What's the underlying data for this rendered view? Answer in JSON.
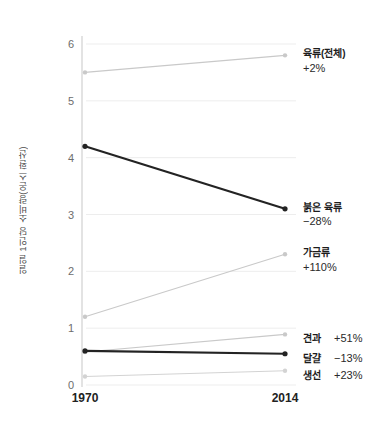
{
  "chart_data": {
    "type": "line",
    "title": "",
    "subtitle": "",
    "xlabel": "",
    "ylabel": "일일 1인당 소비량(온스 환산)",
    "x": [
      "1970",
      "2014"
    ],
    "xtick_labels": [
      "1970",
      "2014"
    ],
    "ytick_labels": [
      "0",
      "1",
      "2",
      "3",
      "4",
      "5",
      "6"
    ],
    "ylim": [
      0,
      6.2
    ],
    "yticks": [
      0,
      1,
      2,
      3,
      4,
      5,
      6
    ],
    "grid": true,
    "legend_position": "right-inline-annotations",
    "series": [
      {
        "name": "육류(전체)",
        "change": "+2%",
        "values": [
          5.5,
          5.8
        ],
        "color": "#c9c9c9",
        "emphasis": false
      },
      {
        "name": "붉은 육류",
        "change": "−28%",
        "values": [
          4.2,
          3.1
        ],
        "color": "#232323",
        "emphasis": true
      },
      {
        "name": "가금류",
        "change": "+110%",
        "values": [
          1.2,
          2.3
        ],
        "color": "#c9c9c9",
        "emphasis": false
      },
      {
        "name": "견과",
        "change": "+51%",
        "values": [
          0.58,
          0.89
        ],
        "color": "#c9c9c9",
        "emphasis": false
      },
      {
        "name": "달걀",
        "change": "−13%",
        "values": [
          0.6,
          0.55
        ],
        "color": "#232323",
        "emphasis": true
      },
      {
        "name": "생선",
        "change": "+23%",
        "values": [
          0.15,
          0.25
        ],
        "color": "#d3d3d3",
        "emphasis": false
      }
    ]
  },
  "style": {
    "background": "#ffffff",
    "grid_color": "#ededed",
    "axis_color": "#d0d0d0",
    "tick_text_color": "#6d6d6d",
    "label_text_color": "#1c1c1c",
    "accent_dark": "#232323",
    "accent_light": "#c9c9c9"
  }
}
